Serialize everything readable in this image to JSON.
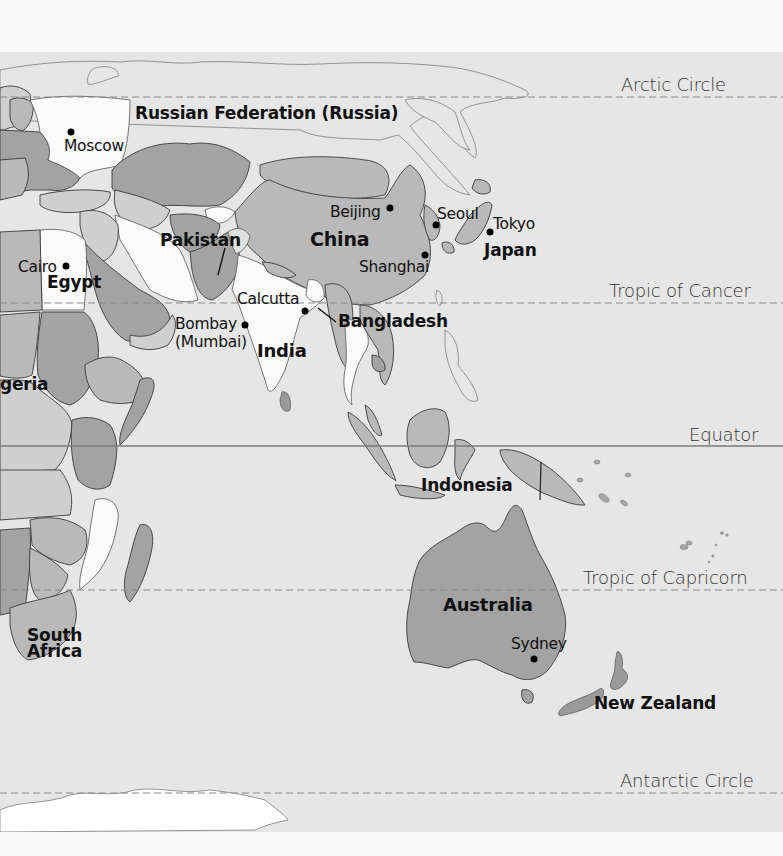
{
  "map": {
    "colors": {
      "ocean": "#e6e6e6",
      "land_light": "#cfcfcf",
      "land_mid": "#b9b9b9",
      "land_dark": "#a3a3a3",
      "highlight_white": "#fafafa",
      "border": "#3a3a3a",
      "latitude_line": "#8a8a8a"
    },
    "latitude_lines": [
      {
        "label": "Arctic Circle",
        "style": "dashed",
        "y": 97
      },
      {
        "label": "Tropic of Cancer",
        "style": "dashed",
        "y": 303
      },
      {
        "label": "Equator",
        "style": "solid",
        "y": 446
      },
      {
        "label": "Tropic of Capricorn",
        "style": "dashed",
        "y": 590
      },
      {
        "label": "Antarctic Circle",
        "style": "dashed",
        "y": 793
      }
    ],
    "countries": [
      {
        "label": "Russian Federation (Russia)"
      },
      {
        "label": "China"
      },
      {
        "label": "Pakistan"
      },
      {
        "label": "Egypt"
      },
      {
        "label": "India"
      },
      {
        "label": "Bangladesh"
      },
      {
        "label": "Japan"
      },
      {
        "label": "Indonesia"
      },
      {
        "label": "Australia"
      },
      {
        "label": "New Zealand"
      },
      {
        "label": "South Africa",
        "line1": "South",
        "line2": "Africa"
      },
      {
        "label": "Nigeria",
        "visible_text": "geria"
      }
    ],
    "cities": [
      {
        "label": "Moscow"
      },
      {
        "label": "Beijing"
      },
      {
        "label": "Seoul"
      },
      {
        "label": "Tokyo"
      },
      {
        "label": "Shanghai"
      },
      {
        "label": "Cairo"
      },
      {
        "label": "Calcutta"
      },
      {
        "label": "Bombay",
        "alt": "(Mumbai)"
      },
      {
        "label": "Sydney"
      }
    ]
  }
}
